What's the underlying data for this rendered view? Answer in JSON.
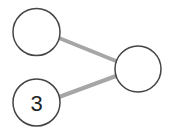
{
  "diagram": {
    "type": "graph",
    "colors": {
      "edge": "#a6a6a6",
      "node_stroke": "#444444",
      "node_fill": "#ffffff",
      "label": "#222222"
    },
    "nodes": [
      {
        "id": "top-left",
        "label": ""
      },
      {
        "id": "right",
        "label": ""
      },
      {
        "id": "bottom-left",
        "label": "3"
      }
    ],
    "edges": [
      {
        "from": "top-left",
        "to": "right"
      },
      {
        "from": "bottom-left",
        "to": "right"
      }
    ]
  }
}
